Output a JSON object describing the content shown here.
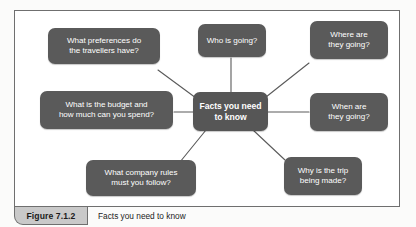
{
  "figure": {
    "label": "Figure 7.1.2",
    "caption": "Facts you need to know"
  },
  "diagram": {
    "type": "mind-map",
    "center": {
      "id": "center",
      "text": "Facts you need\nto know"
    },
    "nodes": [
      {
        "id": "preferences",
        "text": "What preferences do\nthe travellers have?"
      },
      {
        "id": "who-going",
        "text": "Who is going?"
      },
      {
        "id": "where-going",
        "text": "Where are\nthey going?"
      },
      {
        "id": "budget",
        "text": "What is the budget and\nhow much can you spend?"
      },
      {
        "id": "when-going",
        "text": "When are\nthey going?"
      },
      {
        "id": "company-rules",
        "text": "What company rules\nmust you follow?"
      },
      {
        "id": "why-trip",
        "text": "Why is the trip\nbeing made?"
      }
    ]
  },
  "colors": {
    "node_fill": "#5a5a5a",
    "node_text": "#ffffff",
    "connector": "#5a5a5a",
    "frame_border": "#6f6f6f",
    "label_fill": "#c9c9c9",
    "page_background": "#ffffff"
  }
}
